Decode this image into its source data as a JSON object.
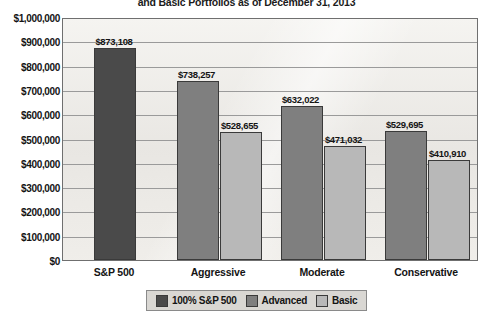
{
  "chart_data": {
    "type": "bar",
    "title": "and Basic Portfolios as of December 31, 2013",
    "xlabel": "",
    "ylabel": "",
    "ylim": [
      0,
      1000000
    ],
    "ytick_labels": [
      "$1,000,000",
      "$900,000",
      "$800,000",
      "$700,000",
      "$600,000",
      "$500,000",
      "$400,000",
      "$300,000",
      "$200,000",
      "$100,000",
      "$0"
    ],
    "ytick_values": [
      1000000,
      900000,
      800000,
      700000,
      600000,
      500000,
      400000,
      300000,
      200000,
      100000,
      0
    ],
    "grid": true,
    "legend_position": "bottom",
    "categories": [
      "S&P 500",
      "Aggressive",
      "Moderate",
      "Conservative"
    ],
    "series": [
      {
        "name": "100% S&P 500",
        "color": "#4a4a4a",
        "values": [
          873108,
          null,
          null,
          null
        ],
        "labels": [
          "$873,108",
          "",
          "",
          ""
        ]
      },
      {
        "name": "Advanced",
        "color": "#7f7f7f",
        "values": [
          null,
          738257,
          632022,
          529695
        ],
        "labels": [
          "",
          "$738,257",
          "$632,022",
          "$529,695"
        ]
      },
      {
        "name": "Basic",
        "color": "#b8b8b8",
        "values": [
          null,
          528655,
          471032,
          410910
        ],
        "labels": [
          "",
          "$528,655",
          "$471,032",
          "$410,910"
        ]
      }
    ]
  },
  "legend": {
    "items": [
      {
        "label": "100% S&P 500",
        "color": "#4a4a4a"
      },
      {
        "label": "Advanced",
        "color": "#7f7f7f"
      },
      {
        "label": "Basic",
        "color": "#b8b8b8"
      }
    ]
  }
}
